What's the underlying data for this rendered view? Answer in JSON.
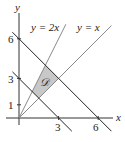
{
  "diagram": {
    "axes": {
      "x_label": "x",
      "y_label": "y",
      "x_ticks": [
        {
          "value": 3,
          "label": "3"
        },
        {
          "value": 6,
          "label": "6"
        }
      ],
      "y_ticks": [
        {
          "value": 1,
          "label": "1"
        },
        {
          "value": 3,
          "label": "3"
        },
        {
          "value": 6,
          "label": "6"
        }
      ]
    },
    "lines": [
      {
        "id": "y2x",
        "equation": "y = 2x",
        "label": "y = 2x"
      },
      {
        "id": "yx",
        "equation": "y = x",
        "label": "y = x"
      },
      {
        "id": "xy3",
        "equation": "x + y = 3"
      },
      {
        "id": "xy6",
        "equation": "x + y = 6"
      }
    ],
    "region": {
      "label": "𝒟",
      "description": "Region bounded by y = x, y = 2x, x + y = 3, x + y = 6",
      "vertices": [
        [
          1,
          2
        ],
        [
          2,
          4
        ],
        [
          3,
          3
        ],
        [
          1.5,
          1.5
        ]
      ],
      "fill": "#c8c8c8"
    }
  }
}
